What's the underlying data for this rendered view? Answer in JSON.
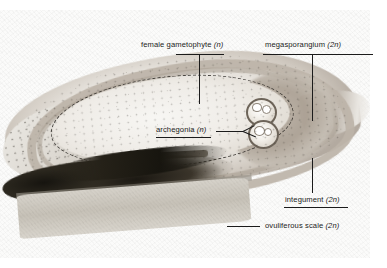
{
  "figure": {
    "kind": "light-micrograph",
    "background_color": "#ffffff",
    "plate_color": "#fbfbfa",
    "annotation_color": "#1b1b1b"
  },
  "labels": {
    "female_gametophyte": {
      "name": "female gametophyte",
      "ploidy": "(n)",
      "full": "female gametophyte (n)"
    },
    "megasporangium": {
      "name": "megasporangium",
      "ploidy": "(2n)",
      "full": "megasporangium (2n)"
    },
    "archegonia": {
      "name": "archegonia",
      "ploidy": "(n)",
      "full": "archegonia (n)"
    },
    "integument": {
      "name": "integument",
      "ploidy": "(2n)",
      "full": "integument (2n)"
    },
    "ovuliferous_scale": {
      "name": "ovuliferous scale",
      "ploidy": "(2n)",
      "full": "ovuliferous scale (2n)"
    }
  },
  "structures": {
    "archegonia_count": 2,
    "gametophyte_boundary_style": "dashed",
    "integument_style": "thick outer ring",
    "dark_band": "stained chalazal tissue",
    "scale": "ovuliferous scale slab"
  }
}
